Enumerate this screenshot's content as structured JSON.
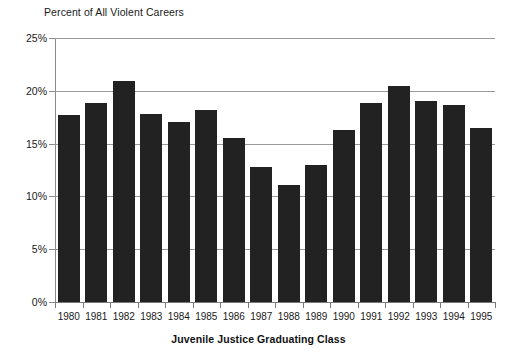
{
  "chart_data": {
    "type": "bar",
    "title": "",
    "ylabel": "Percent of All Violent Careers",
    "xlabel": "Juvenile Justice Graduating Class",
    "categories": [
      "1980",
      "1981",
      "1982",
      "1983",
      "1984",
      "1985",
      "1986",
      "1987",
      "1988",
      "1989",
      "1990",
      "1991",
      "1992",
      "1993",
      "1994",
      "1995"
    ],
    "values": [
      17.7,
      18.8,
      20.9,
      17.8,
      17.0,
      18.2,
      15.5,
      12.8,
      11.1,
      13.0,
      16.3,
      18.8,
      20.5,
      19.0,
      18.7,
      16.5
    ],
    "ylim": [
      0,
      25
    ],
    "ytick_values": [
      0,
      5,
      10,
      15,
      20,
      25
    ],
    "ytick_labels": [
      "0%",
      "5%",
      "10%",
      "15%",
      "20%",
      "25%"
    ],
    "grid": true,
    "legend": false,
    "bar_color": "#222222",
    "grid_color": "#9a9a9a",
    "axis_color": "#8a8a8a"
  }
}
